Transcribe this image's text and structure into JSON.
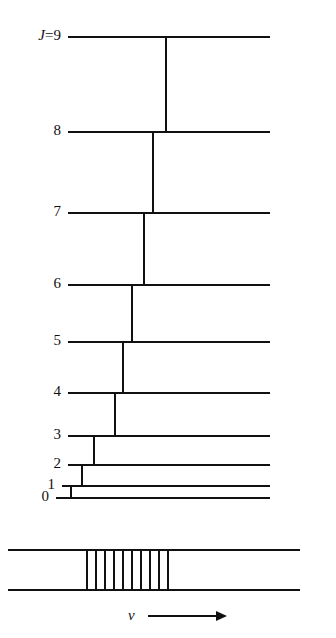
{
  "figure": {
    "type": "energy-level-diagram",
    "width": 336,
    "height": 638,
    "ink_color": "#111111",
    "background_color": "#ffffff"
  },
  "levels": [
    {
      "id": "J9",
      "label": "9",
      "label_prefix": "J",
      "label_equals": "=",
      "is_top": true,
      "y": 36,
      "x1": 68,
      "x2": 270
    },
    {
      "id": "J8",
      "label": "8",
      "is_top": false,
      "y": 131,
      "x1": 68,
      "x2": 270
    },
    {
      "id": "J7",
      "label": "7",
      "is_top": false,
      "y": 212,
      "x1": 68,
      "x2": 270
    },
    {
      "id": "J6",
      "label": "6",
      "is_top": false,
      "y": 284,
      "x1": 68,
      "x2": 270
    },
    {
      "id": "J5",
      "label": "5",
      "is_top": false,
      "y": 341,
      "x1": 68,
      "x2": 270
    },
    {
      "id": "J4",
      "label": "4",
      "is_top": false,
      "y": 392,
      "x1": 68,
      "x2": 270
    },
    {
      "id": "J3",
      "label": "3",
      "is_top": false,
      "y": 435,
      "x1": 68,
      "x2": 270
    },
    {
      "id": "J2",
      "label": "2",
      "is_top": false,
      "y": 464,
      "x1": 68,
      "x2": 270
    },
    {
      "id": "J1",
      "label": "1",
      "is_top": false,
      "y": 485,
      "x1": 62,
      "x2": 270
    },
    {
      "id": "J0",
      "label": "0",
      "is_top": false,
      "y": 497,
      "x1": 56,
      "x2": 270
    }
  ],
  "transitions": [
    {
      "id": "t9-8",
      "from": "9",
      "to": "8",
      "x": 165,
      "y1": 36,
      "y2": 131
    },
    {
      "id": "t8-7",
      "from": "8",
      "to": "7",
      "x": 152,
      "y1": 131,
      "y2": 212
    },
    {
      "id": "t7-6",
      "from": "7",
      "to": "6",
      "x": 143,
      "y1": 212,
      "y2": 284
    },
    {
      "id": "t6-5",
      "from": "6",
      "to": "5",
      "x": 131,
      "y1": 284,
      "y2": 341
    },
    {
      "id": "t5-4",
      "from": "5",
      "to": "4",
      "x": 122,
      "y1": 341,
      "y2": 392
    },
    {
      "id": "t4-3",
      "from": "4",
      "to": "3",
      "x": 114,
      "y1": 392,
      "y2": 435
    },
    {
      "id": "t3-2",
      "from": "3",
      "to": "2",
      "x": 93,
      "y1": 435,
      "y2": 464
    },
    {
      "id": "t2-1",
      "from": "2",
      "to": "1",
      "x": 81,
      "y1": 464,
      "y2": 485
    },
    {
      "id": "t1-0",
      "from": "1",
      "to": "0",
      "x": 70,
      "y1": 485,
      "y2": 497
    }
  ],
  "spectrum": {
    "top_rail": {
      "y": 549,
      "x1": 8,
      "x2": 300
    },
    "bottom_rail": {
      "y": 589,
      "x1": 8,
      "x2": 300
    },
    "line_count": 10,
    "lines_x": [
      86,
      95,
      104,
      113,
      122,
      131,
      140,
      149,
      158,
      167
    ],
    "axis": {
      "symbol": "ν",
      "symbol_x": 128,
      "symbol_y": 608,
      "arrow_x1": 148,
      "arrow_x2": 216,
      "arrow_y": 615
    }
  }
}
